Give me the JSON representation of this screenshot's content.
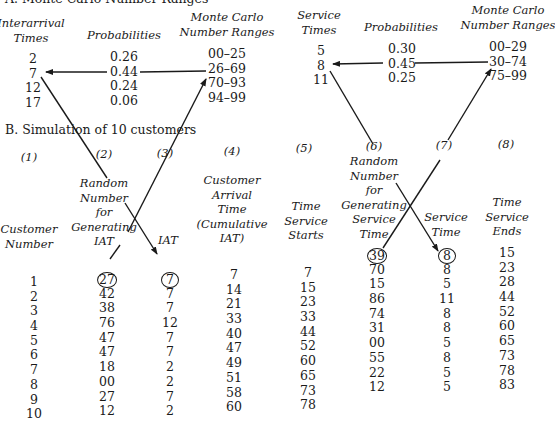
{
  "section_a": {
    "title": "A. Monte Carlo Number Ranges",
    "interarrival": {
      "headers": {
        "times": [
          "Interarrival",
          "Times"
        ],
        "probabilities": "Probabilities",
        "ranges": [
          "Monte Carlo",
          "Number Ranges"
        ]
      },
      "rows": [
        {
          "time": "2",
          "prob": "0.26",
          "range": "00–25"
        },
        {
          "time": "7",
          "prob": "0.44",
          "range": "26–69"
        },
        {
          "time": "12",
          "prob": "0.24",
          "range": "70–93"
        },
        {
          "time": "17",
          "prob": "0.06",
          "range": "94–99"
        }
      ]
    },
    "service": {
      "headers": {
        "times": [
          "Service",
          "Times"
        ],
        "probabilities": "Probabilities",
        "ranges": [
          "Monte Carlo",
          "Number Ranges"
        ]
      },
      "rows": [
        {
          "time": "5",
          "prob": "0.30",
          "range": "00–29"
        },
        {
          "time": "8",
          "prob": "0.45",
          "range": "30–74"
        },
        {
          "time": "11",
          "prob": "0.25",
          "range": "75–99"
        }
      ]
    }
  },
  "section_b": {
    "title": "B. Simulation of 10 customers",
    "column_numbers": [
      "(1)",
      "(2)",
      "(3)",
      "(4)",
      "(5)",
      "(6)",
      "(7)",
      "(8)"
    ],
    "column_headers": [
      [
        "Customer",
        "Number"
      ],
      [
        "Random",
        "Number",
        "for",
        "Generating",
        "IAT"
      ],
      [
        "IAT"
      ],
      [
        "Customer",
        "Arrival",
        "Time",
        "(Cumulative",
        "IAT)"
      ],
      [
        "Time",
        "Service",
        "Starts"
      ],
      [
        "Random",
        "Number",
        "for",
        "Generating",
        "Service",
        "Time"
      ],
      [
        "Service",
        "Time"
      ],
      [
        "Time",
        "Service",
        "Ends"
      ]
    ],
    "columns": {
      "customer_number": [
        "1",
        "2",
        "3",
        "4",
        "5",
        "6",
        "7",
        "8",
        "9",
        "10"
      ],
      "rn_iat": [
        "27",
        "42",
        "38",
        "76",
        "47",
        "47",
        "18",
        "00",
        "27",
        "12"
      ],
      "iat": [
        "7",
        "7",
        "7",
        "12",
        "7",
        "7",
        "2",
        "2",
        "7",
        "2"
      ],
      "arrival_time": [
        "7",
        "14",
        "21",
        "33",
        "40",
        "47",
        "49",
        "51",
        "58",
        "60"
      ],
      "service_starts": [
        "7",
        "15",
        "23",
        "33",
        "44",
        "52",
        "60",
        "65",
        "73",
        "78"
      ],
      "rn_service": [
        "39",
        "70",
        "15",
        "86",
        "74",
        "31",
        "00",
        "55",
        "22",
        "12"
      ],
      "service_time": [
        "8",
        "8",
        "5",
        "11",
        "8",
        "8",
        "5",
        "8",
        "5",
        "5"
      ],
      "service_ends": [
        "15",
        "23",
        "28",
        "44",
        "52",
        "60",
        "65",
        "73",
        "78",
        "83"
      ]
    },
    "circled_first_row": [
      "rn_iat",
      "iat",
      "rn_service",
      "service_time"
    ]
  }
}
